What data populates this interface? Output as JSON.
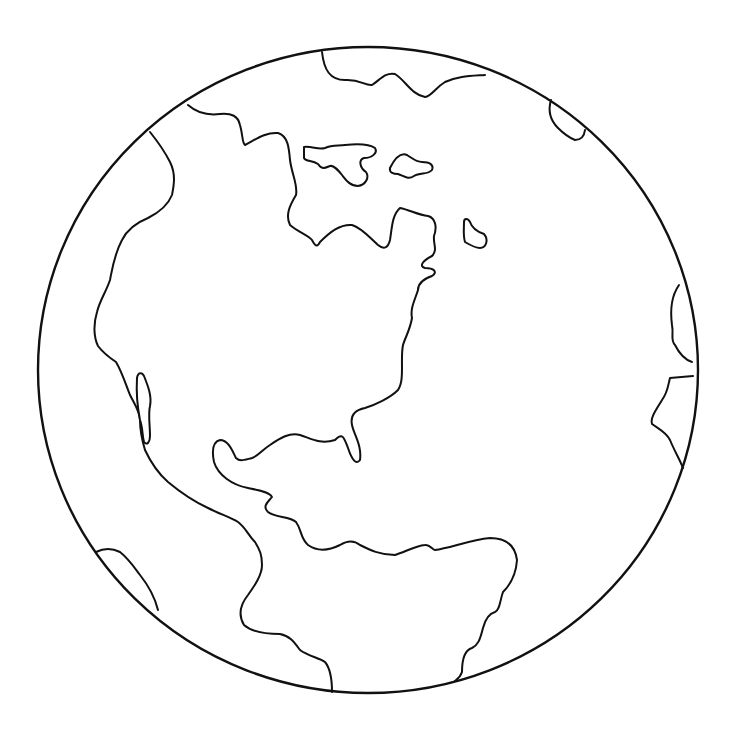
{
  "drawing": {
    "subject": "globe-americas-coloring-page",
    "colors": {
      "background": "#ffffff",
      "line": "#111111"
    },
    "globe": {
      "cx": 368,
      "cy": 370,
      "rx": 330,
      "ry": 323
    },
    "coastlines": [
      {
        "name": "greenland-top",
        "d": "M322 52 C 324 70, 330 80, 345 80 C 360 79, 365 86, 372 85 C 380 80, 385 72, 395 74 C 405 80, 412 95, 425 97 C 432 96, 435 88, 445 82 C 458 76, 470 76, 485 75"
      },
      {
        "name": "north-america-north-coast",
        "d": "M188 105 C 196 112, 205 116, 220 114 C 232 113, 238 116, 240 125 C 243 135, 242 143, 245 145 C 255 140, 265 132, 278 133 C 288 136, 289 148, 290 160 C 292 175, 298 185, 296 195 C 290 205, 285 215, 290 225 C 298 232, 308 235, 312 240 C 316 248, 318 246, 320 242 C 330 232, 340 224, 352 225 C 362 228, 370 238, 378 245 C 384 250, 388 248, 390 240 C 392 228, 392 215, 400 208 C 410 210, 418 215, 428 216 C 436 218, 437 228, 434 236 C 433 244, 438 250, 432 256 C 424 260, 418 266, 425 268 C 434 268, 438 272, 432 276 C 420 280, 418 285, 418 290 C 415 300, 410 308, 412 318 C 410 330, 405 338, 403 345 C 400 360, 405 380, 398 390 C 390 398, 375 405, 365 408 C 355 410, 350 415, 352 425 C 354 435, 362 445, 360 460 C 356 465, 352 460, 348 448 C 344 438, 343 432, 335 440 C 320 445, 310 438, 300 435 C 290 432, 280 438, 270 445 C 262 450, 258 456, 252 458 C 244 460, 240 462, 236 458 C 232 450, 228 440, 220 440 C 212 442, 212 452, 214 462 C 218 475, 232 485, 248 488 C 258 490, 270 492, 272 497 C 268 502, 262 506, 268 512 C 275 518, 290 516, 296 522 C 302 530, 300 538, 308 545 C 318 552, 330 550, 340 545 C 348 540, 354 540, 360 545 C 370 550, 380 555, 395 555 C 405 552, 415 546, 425 545 C 430 544, 432 550, 435 550 C 450 548, 470 540, 490 538 C 505 538, 515 545, 517 560 C 516 575, 510 585, 503 592 C 500 600, 500 610, 495 612 C 488 614, 485 620, 483 628 C 480 640, 478 645, 472 648 C 465 650, 462 660, 462 672 C 460 678, 456 680, 455 681"
      },
      {
        "name": "west-coast-mexico-south-america",
        "d": "M150 132 C 158 142, 165 152, 170 162 C 176 174, 174 185, 172 195 C 168 205, 160 212, 148 218 C 138 222, 128 228, 122 240 C 114 255, 112 270, 110 280 C 106 292, 100 300, 97 312 C 93 325, 94 338, 98 346 C 104 354, 110 358, 116 362 C 122 372, 126 385, 130 395 C 135 405, 140 412, 140 420 C 140 428, 142 440, 145 450 C 152 465, 160 475, 168 482 C 180 492, 195 502, 208 508 C 220 514, 232 518, 238 522 C 246 528, 248 535, 255 542 C 260 550, 262 555, 262 565 C 262 575, 255 585, 248 595 C 240 605, 238 615, 244 625 C 252 632, 265 634, 280 634 C 290 636, 294 642, 300 650 C 308 656, 320 658, 325 662 C 330 668, 332 680, 332 692"
      },
      {
        "name": "europe-africa-edge",
        "d": "M679 285 C 672 295, 670 310, 672 325 C 674 335, 670 340, 675 345 C 680 355, 686 360, 692 362"
      },
      {
        "name": "africa-bulge",
        "d": "M693 376 L 670 378 C 668 385, 668 392, 662 400 C 656 410, 650 418, 652 424 C 660 430, 666 432, 670 440 C 674 450, 680 460, 683 468"
      },
      {
        "name": "europe-top-right",
        "d": "M551 100 C 548 110, 550 120, 558 128 C 564 134, 570 138, 575 140 C 580 140, 584 138, 585 130"
      },
      {
        "name": "antarctic-left",
        "d": "M96 552 C 104 548, 112 548, 120 552 C 130 560, 136 570, 140 575 C 148 585, 155 598, 158 610"
      }
    ],
    "islands": [
      {
        "name": "baffin-island",
        "d": "M304 147 C 312 146, 318 150, 325 148 C 332 145, 338 146, 345 145 C 355 144, 368 143, 375 148 C 378 153, 372 158, 364 158 C 358 160, 360 168, 366 172 C 370 178, 365 185, 358 186 C 350 186, 346 180, 342 175 C 338 170, 334 165, 330 166 C 325 168, 322 170, 318 164 C 312 160, 306 162, 304 158 Z"
      },
      {
        "name": "ellesmere-island",
        "d": "M390 168 C 394 160, 400 152, 407 155 C 412 158, 416 162, 422 162 C 430 162, 434 165, 432 170 C 428 175, 420 172, 414 176 C 408 180, 404 176, 398 174 C 394 174, 389 173, 390 168 Z"
      },
      {
        "name": "newfoundland",
        "d": "M464 222 C 464 218, 468 218, 470 222 C 472 228, 478 232, 484 234 C 489 240, 486 248, 480 248 C 476 248, 470 245, 465 242 C 463 236, 464 228, 464 222 Z"
      },
      {
        "name": "baja-california",
        "d": "M137 378 C 138 372, 142 372, 144 376 C 148 386, 152 396, 150 406 C 148 414, 150 425, 150 436 C 150 442, 147 446, 144 442 C 142 435, 143 428, 140 420 C 138 410, 136 395, 137 378 Z"
      }
    ]
  }
}
